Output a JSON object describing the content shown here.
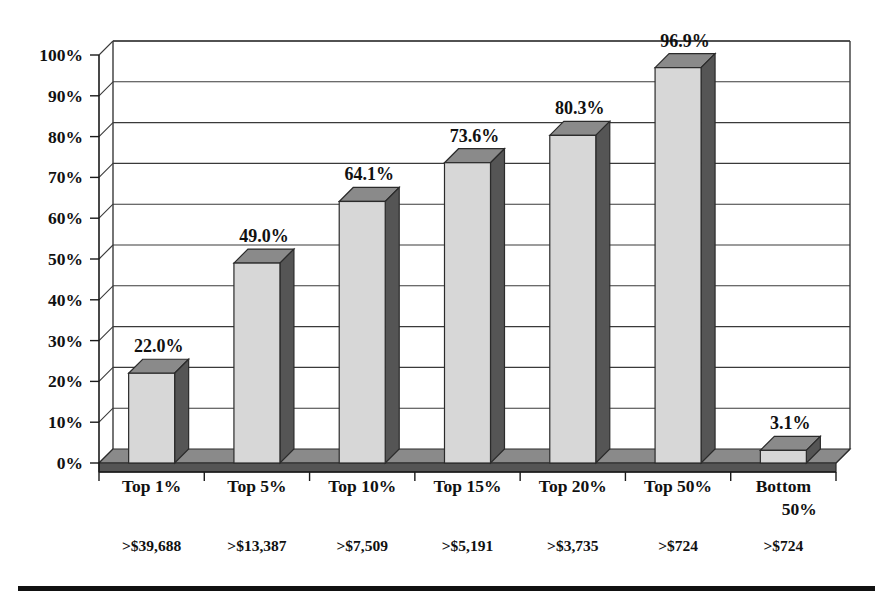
{
  "chart_data": {
    "type": "bar",
    "title": "",
    "subtitle": "",
    "xlabel": "",
    "ylabel": "",
    "ylim": [
      0,
      100
    ],
    "grid": true,
    "legend": null,
    "style": "3d-column",
    "categories": [
      "Top 1%",
      "Top 5%",
      "Top 10%",
      "Top 15%",
      "Top 20%",
      "Top 50%",
      "Bottom 50%"
    ],
    "category_sublabels": [
      ">$39,688",
      ">$13,387",
      ">$7,509",
      ">$5,191",
      ">$3,735",
      ">$724",
      ">$724"
    ],
    "values": [
      22.0,
      49.0,
      64.1,
      73.6,
      80.3,
      96.9,
      3.1
    ],
    "data_labels": [
      "22.0%",
      "49.0%",
      "64.1%",
      "73.6%",
      "80.3%",
      "96.9%",
      "3.1%"
    ],
    "yticks": [
      0,
      10,
      20,
      30,
      40,
      50,
      60,
      70,
      80,
      90,
      100
    ],
    "ytick_labels": [
      "0%",
      "10%",
      "20%",
      "30%",
      "40%",
      "50%",
      "60%",
      "70%",
      "80%",
      "90%",
      "100%"
    ]
  },
  "colors": {
    "bar_front": "#d7d7d7",
    "bar_side": "#555555",
    "bar_top": "#8a8a8a",
    "floor_front": "#555555",
    "floor_top": "#8a8a8a",
    "gridline": "#3a3a3a",
    "axis": "#1a1a1a",
    "text": "#111111",
    "background": "#ffffff",
    "bottom_rule": "#111111"
  }
}
